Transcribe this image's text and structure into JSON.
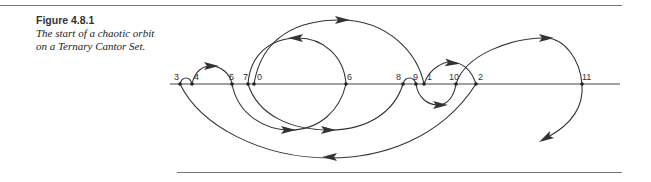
{
  "figure": {
    "label": "Figure  4.8.1",
    "caption_line1": "The start of a chaotic orbit",
    "caption_line2": "on a Ternary Cantor Set."
  },
  "diagram": {
    "axis": {
      "x1": 170,
      "x2": 620,
      "y": 84
    },
    "points": [
      {
        "label": "3",
        "x": 180,
        "lx": 174,
        "ly": 80
      },
      {
        "label": "4",
        "x": 192,
        "lx": 194,
        "ly": 80
      },
      {
        "label": "5",
        "x": 232,
        "lx": 229,
        "ly": 80
      },
      {
        "label": "7",
        "x": 248,
        "lx": 243,
        "ly": 80
      },
      {
        "label": "0",
        "x": 254,
        "lx": 257,
        "ly": 80
      },
      {
        "label": "6",
        "x": 346,
        "lx": 347,
        "ly": 80
      },
      {
        "label": "8",
        "x": 403,
        "lx": 396,
        "ly": 80
      },
      {
        "label": "9",
        "x": 416,
        "lx": 413,
        "ly": 80
      },
      {
        "label": "1",
        "x": 424,
        "lx": 427,
        "ly": 80
      },
      {
        "label": "10",
        "x": 456,
        "lx": 449,
        "ly": 80
      },
      {
        "label": "2",
        "x": 476,
        "lx": 478,
        "ly": 80
      },
      {
        "label": "11",
        "x": 582,
        "lx": 582,
        "ly": 80
      }
    ],
    "arcs": [
      {
        "name": "orbit-0-to-1",
        "d": "M254 84 C 262 35, 300 20, 340 20 C 390 20, 418 55, 424 84",
        "arrow": {
          "x": 342,
          "y": 20,
          "angle": 0
        }
      },
      {
        "name": "orbit-1-to-2",
        "d": "M424 84 C 430 66, 446 62, 450 62 C 464 62, 472 72, 476 84",
        "arrow": {
          "x": 452,
          "y": 63,
          "angle": 5
        }
      },
      {
        "name": "orbit-2-to-3",
        "d": "M476 84 C 440 140, 380 158, 330 158 C 260 158, 200 125, 180 84",
        "arrow": {
          "x": 330,
          "y": 157,
          "angle": 180
        }
      },
      {
        "name": "orbit-3-to-4",
        "d": "M180 84 C 182 76, 190 76, 192 84",
        "arrow": null
      },
      {
        "name": "orbit-4-to-5",
        "d": "M192 84 C 195 70, 204 66, 210 66 C 222 66, 230 74, 232 84",
        "arrow": {
          "x": 211,
          "y": 66,
          "angle": 0
        }
      },
      {
        "name": "orbit-5-to-6",
        "d": "M232 84 C 238 115, 265 130, 290 130 C 320 130, 340 110, 346 84",
        "arrow": {
          "x": 288,
          "y": 130,
          "angle": 0
        }
      },
      {
        "name": "orbit-6-to-7",
        "d": "M346 84 C 344 55, 322 38, 298 38 C 270 38, 250 55, 248 84",
        "arrow": {
          "x": 296,
          "y": 38,
          "angle": 180
        }
      },
      {
        "name": "orbit-7-to-8",
        "d": "M248 84 C 258 115, 290 130, 330 130 C 370 130, 395 110, 403 84",
        "arrow": {
          "x": 328,
          "y": 130,
          "angle": 0
        }
      },
      {
        "name": "orbit-8-to-9",
        "d": "M403 84 C 405 76, 414 76, 416 84",
        "arrow": null
      },
      {
        "name": "orbit-9-to-10",
        "d": "M416 84 C 418 98, 428 105, 438 105 C 448 105, 454 96, 456 84",
        "arrow": {
          "x": 440,
          "y": 105,
          "angle": 0
        }
      },
      {
        "name": "orbit-10-to-11",
        "d": "M456 84 C 465 55, 510 38, 545 38 C 565 38, 580 60, 582 84",
        "arrow": {
          "x": 546,
          "y": 38,
          "angle": 0
        }
      },
      {
        "name": "orbit-11-to-next",
        "d": "M582 84 C 584 108, 570 125, 548 137",
        "arrow": {
          "x": 546,
          "y": 138,
          "angle": 150
        }
      }
    ]
  }
}
